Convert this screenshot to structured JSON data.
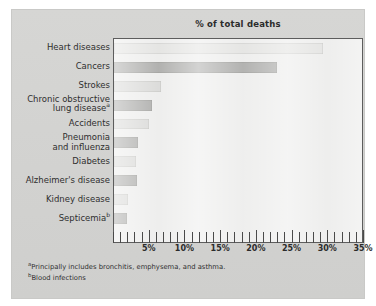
{
  "figure": {
    "background_color": "#d4d4d2",
    "plot_background_color": "#ececeb"
  },
  "chart_data": {
    "type": "bar",
    "orientation": "horizontal",
    "title": "% of total deaths",
    "xlabel": "",
    "ylabel": "",
    "xlim": [
      0,
      35
    ],
    "ylim": null,
    "grid": false,
    "legend": null,
    "tick_labels": [
      "5%",
      "10%",
      "15%",
      "20%",
      "25%",
      "30%",
      "35%"
    ],
    "tick_values": [
      5,
      10,
      15,
      20,
      25,
      30,
      35
    ],
    "minor_tick_interval": 1,
    "bar_color": "#a8a8a6",
    "categories": [
      "Heart diseases",
      "Cancers",
      "Strokes",
      "Chronic obstructive lung diseaseᵃ",
      "Accidents",
      "Pneumonia and influenza",
      "Diabetes",
      "Alzheimer's disease",
      "Kidney disease",
      "Septicemiaᵇ"
    ],
    "values": [
      29.5,
      23.0,
      6.6,
      5.4,
      4.9,
      3.4,
      3.1,
      3.3,
      2.0,
      1.8
    ],
    "bars": [
      {
        "label_line1": "Heart diseases",
        "label_line2": "",
        "sup": "",
        "value": 29.5,
        "shade": "pale"
      },
      {
        "label_line1": "Cancers",
        "label_line2": "",
        "sup": "",
        "value": 23.0,
        "shade": "dark"
      },
      {
        "label_line1": "Strokes",
        "label_line2": "",
        "sup": "",
        "value": 6.6,
        "shade": "mid"
      },
      {
        "label_line1": "Chronic obstructive",
        "label_line2": "lung disease",
        "sup": "a",
        "value": 5.4,
        "shade": "dark"
      },
      {
        "label_line1": "Accidents",
        "label_line2": "",
        "sup": "",
        "value": 4.9,
        "shade": "mid"
      },
      {
        "label_line1": "Pneumonia",
        "label_line2": "and influenza",
        "sup": "",
        "value": 3.4,
        "shade": "dark"
      },
      {
        "label_line1": "Diabetes",
        "label_line2": "",
        "sup": "",
        "value": 3.1,
        "shade": "mid"
      },
      {
        "label_line1": "Alzheimer's disease",
        "label_line2": "",
        "sup": "",
        "value": 3.3,
        "shade": "dark"
      },
      {
        "label_line1": "Kidney disease",
        "label_line2": "",
        "sup": "",
        "value": 2.0,
        "shade": "mid"
      },
      {
        "label_line1": "Septicemia",
        "label_line2": "",
        "sup": "b",
        "value": 1.8,
        "shade": "dark"
      }
    ]
  },
  "footnotes": [
    {
      "marker": "a",
      "text": "Principally includes bronchitis, emphysema, and asthma."
    },
    {
      "marker": "b",
      "text": "Blood infections"
    }
  ]
}
